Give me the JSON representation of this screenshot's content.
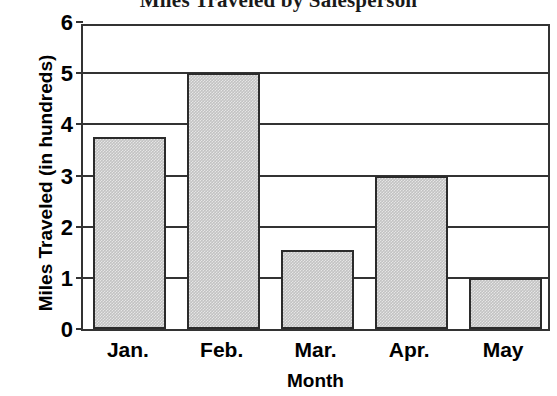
{
  "chart_data": {
    "type": "bar",
    "title": "Miles Traveled by Salesperson",
    "xlabel": "Month",
    "ylabel": "Miles Traveled (in hundreds)",
    "categories": [
      "Jan.",
      "Feb.",
      "Mar.",
      "Apr.",
      "May"
    ],
    "values": [
      3.75,
      5,
      1.55,
      3,
      1
    ],
    "ylim": [
      0,
      6
    ],
    "y_ticks": [
      "0",
      "1",
      "2",
      "3",
      "4",
      "5",
      "6"
    ],
    "grid": true,
    "legend": "none",
    "bar_fill_color": "#c2c2c2",
    "bar_border_color": "#2b2b2b",
    "axis_color": "#333333",
    "background_color": "#ffffff"
  }
}
